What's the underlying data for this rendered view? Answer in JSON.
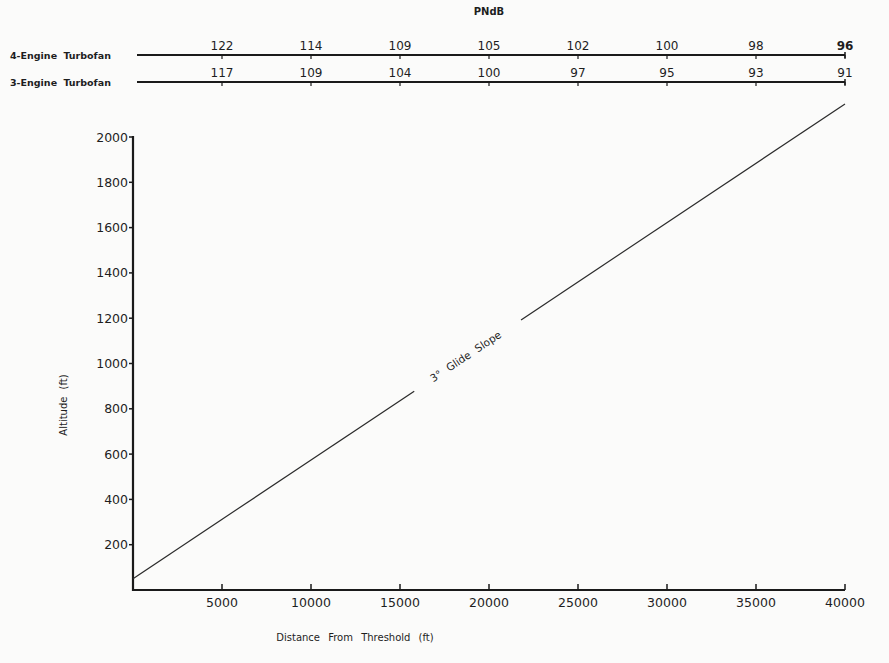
{
  "chart_data": {
    "type": "line",
    "title": "",
    "xlabel": "Distance From Threshold (ft)",
    "ylabel": "Altitude (ft)",
    "xlim": [
      0,
      40000
    ],
    "ylim": [
      0,
      2000
    ],
    "x_ticks": [
      5000,
      10000,
      15000,
      20000,
      25000,
      30000,
      35000,
      40000
    ],
    "y_ticks": [
      200,
      400,
      600,
      800,
      1000,
      1200,
      1400,
      1600,
      1800,
      2000
    ],
    "grid": false,
    "series": [
      {
        "name": "3° Glide Slope",
        "x": [
          0,
          40000
        ],
        "y": [
          50,
          2146
        ]
      }
    ],
    "annotations": [
      {
        "text": "3° Glide Slope",
        "x": 18000,
        "y": 1000
      }
    ],
    "top_scale": {
      "title": "PNdB",
      "positions": [
        5000,
        10000,
        15000,
        20000,
        25000,
        30000,
        35000,
        40000
      ],
      "rows": [
        {
          "name": "4-Engine Turbofan",
          "values": [
            122,
            114,
            109,
            105,
            102,
            100,
            98,
            96
          ]
        },
        {
          "name": "3-Engine Turbofan",
          "values": [
            117,
            109,
            104,
            100,
            97,
            95,
            93,
            91
          ]
        }
      ]
    }
  }
}
